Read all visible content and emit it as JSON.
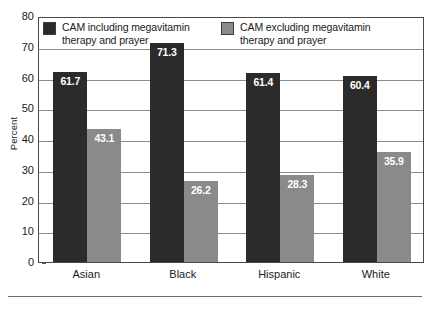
{
  "chart_data": {
    "type": "bar",
    "title": "",
    "subtitle": "",
    "xlabel": "",
    "ylabel": "Percent",
    "ylim": [
      0,
      80
    ],
    "ytick_step": 10,
    "yticks": [
      "80",
      "70",
      "60",
      "50",
      "40",
      "30",
      "20",
      "10",
      "0"
    ],
    "grid": true,
    "grid_axis": "y",
    "legend_position": "top-inside",
    "categories": [
      "Asian",
      "Black",
      "Hispanic",
      "White"
    ],
    "series": [
      {
        "name": "CAM including megavitamin\ntherapy and prayer",
        "color": "#2b2b2b",
        "values": [
          61.7,
          71.3,
          61.4,
          60.4
        ],
        "labels": [
          "61.7",
          "71.3",
          "61.4",
          "60.4"
        ]
      },
      {
        "name": "CAM excluding megavitamin\ntherapy and prayer",
        "color": "#8a8a8a",
        "values": [
          43.1,
          26.2,
          28.3,
          35.9
        ],
        "labels": [
          "43.1",
          "26.2",
          "28.3",
          "35.9"
        ]
      }
    ],
    "value_label_color": "#ffffff"
  },
  "axes": {
    "y_title": "Percent"
  },
  "colors": {
    "series_dark": "#2b2b2b",
    "series_gray": "#8a8a8a",
    "frame": "#4a4a4a",
    "gridline": "#8d8d8d",
    "background": "#ffffff"
  }
}
